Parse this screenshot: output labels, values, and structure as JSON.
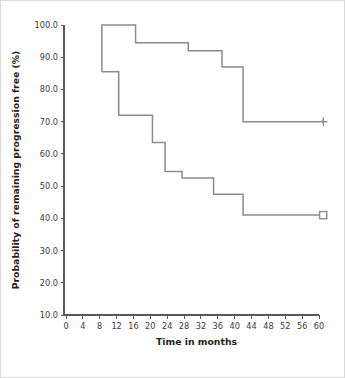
{
  "chart_data": {
    "type": "line",
    "title": "",
    "subtitle": "",
    "xlabel": "Time in months",
    "ylabel": "Probability of remaining progression free (%)",
    "xlim": [
      0,
      60
    ],
    "ylim": [
      10.0,
      100.0
    ],
    "xticks": [
      0,
      4,
      8,
      12,
      16,
      20,
      24,
      28,
      32,
      36,
      40,
      44,
      48,
      52,
      56,
      60
    ],
    "xtick_labels": [
      "0",
      "4",
      "8",
      "12",
      "16",
      "20",
      "24",
      "28",
      "32",
      "36",
      "40",
      "44",
      "48",
      "52",
      "56",
      "60"
    ],
    "yticks": [
      10.0,
      20.0,
      30.0,
      40.0,
      50.0,
      60.0,
      70.0,
      80.0,
      90.0,
      100.0
    ],
    "ytick_labels": [
      "10.0",
      "20.0",
      "30.0",
      "40.0",
      "50.0",
      "60.0",
      "70.0",
      "80.0",
      "90.0",
      "100.0"
    ],
    "grid": false,
    "legend": "none",
    "line_color": "#8c8c8c",
    "axis_color": "#58595b",
    "step_style": "post",
    "series": [
      {
        "name": "upper-curve",
        "end_marker": "plus",
        "x": [
          8.5,
          8.5,
          16.5,
          16.5,
          29.0,
          29.0,
          37.0,
          37.0,
          42.0,
          42.0,
          60.0
        ],
        "y": [
          85.5,
          100.0,
          100.0,
          94.5,
          94.5,
          92.0,
          92.0,
          87.0,
          87.0,
          70.0,
          70.0
        ],
        "steps": [
          {
            "time": 8.5,
            "value": 100.0
          },
          {
            "time": 16.5,
            "value": 94.5
          },
          {
            "time": 29.0,
            "value": 92.0
          },
          {
            "time": 37.0,
            "value": 87.0
          },
          {
            "time": 42.0,
            "value": 70.0
          },
          {
            "time": 60.0,
            "value": 70.0
          }
        ]
      },
      {
        "name": "lower-curve",
        "end_marker": "square",
        "x": [
          8.5,
          8.5,
          12.5,
          12.5,
          20.5,
          20.5,
          23.5,
          23.5,
          27.5,
          27.5,
          35.0,
          35.0,
          42.0,
          42.0,
          60.0
        ],
        "y": [
          85.5,
          85.5,
          85.5,
          72.0,
          72.0,
          63.5,
          63.5,
          54.5,
          54.5,
          52.5,
          52.5,
          47.5,
          47.5,
          41.0,
          41.0
        ],
        "steps": [
          {
            "time": 8.5,
            "value": 85.5
          },
          {
            "time": 12.5,
            "value": 72.0
          },
          {
            "time": 20.5,
            "value": 63.5
          },
          {
            "time": 23.5,
            "value": 54.5
          },
          {
            "time": 27.5,
            "value": 52.5
          },
          {
            "time": 35.0,
            "value": 47.5
          },
          {
            "time": 42.0,
            "value": 41.0
          },
          {
            "time": 60.0,
            "value": 41.0
          }
        ]
      }
    ],
    "markers": [
      {
        "name": "censor-plus",
        "symbol": "+",
        "x": 61.0,
        "y": 70.0
      },
      {
        "name": "censor-square",
        "symbol": "□",
        "x": 61.0,
        "y": 41.0
      }
    ]
  }
}
